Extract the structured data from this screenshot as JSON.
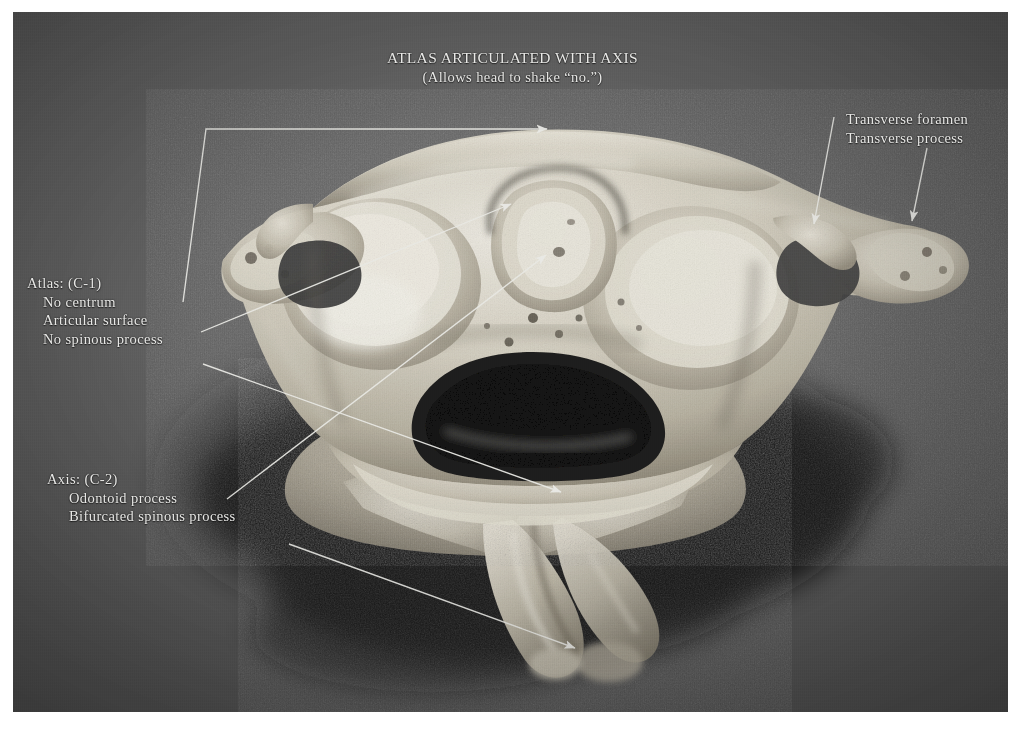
{
  "figure": {
    "domain": "anatomy-photograph",
    "plate_background_color": "#5a5a5a",
    "label_text_color": "#e8e8e6",
    "bone_color": "#dcd8cc",
    "shadow_color": "#141414"
  },
  "title": {
    "main": "ATLAS ARTICULATED WITH AXIS",
    "subtitle": "(Allows head to shake “no.”)"
  },
  "atlas_block": {
    "heading": "Atlas: (C-1)",
    "items": [
      "No centrum",
      "Articular surface",
      "No spinous process"
    ]
  },
  "axis_block": {
    "heading": "Axis: (C-2)",
    "items": [
      "Odontoid process",
      "Bifurcated spinous process"
    ]
  },
  "right_block": {
    "items": [
      "Transverse foramen",
      "Transverse process"
    ]
  },
  "leaders": [
    {
      "name": "atlas-group-leader",
      "label": "Atlas: (C-1)",
      "points": "205,117 545,117",
      "arrow_at": [
        545,
        119
      ],
      "arrow_dir": "right"
    },
    {
      "name": "no-centrum-leader",
      "label": "No centrum",
      "points": "182,290 205,117",
      "arrow_at": null,
      "arrow_dir": "none"
    },
    {
      "name": "articular-surface-leader",
      "label": "Articular surface",
      "points": "200,320 508,192",
      "arrow_at": [
        508,
        192
      ],
      "arrow_dir": "right-up"
    },
    {
      "name": "no-spinous-process-leader",
      "label": "No spinous process",
      "points": "203,352 558,480",
      "arrow_at": [
        558,
        480
      ],
      "arrow_dir": "right-down"
    },
    {
      "name": "odontoid-process-leader",
      "label": "Odontoid process",
      "points": "226,487 542,240",
      "arrow_at": [
        542,
        240
      ],
      "arrow_dir": "right-up"
    },
    {
      "name": "bifurcated-spinous-process-leader",
      "label": "Bifurcated spinous process",
      "points": "288,532 572,636",
      "arrow_at": [
        572,
        636
      ],
      "arrow_dir": "right-down"
    },
    {
      "name": "transverse-foramen-leader",
      "label": "Transverse foramen",
      "points": "833,115 812,222",
      "arrow_at": [
        812,
        222
      ],
      "arrow_dir": "down"
    },
    {
      "name": "transverse-process-leader",
      "label": "Transverse process",
      "points": "926,146 911,219",
      "arrow_at": [
        911,
        219
      ],
      "arrow_dir": "down"
    }
  ]
}
